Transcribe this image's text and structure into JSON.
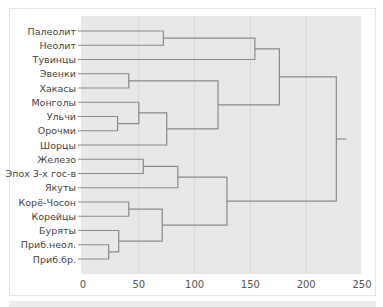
{
  "chart_data": {
    "type": "dendrogram",
    "title": "",
    "xlabel": "",
    "ylabel": "",
    "xlim": [
      0,
      250
    ],
    "x_ticks": [
      0,
      50,
      100,
      150,
      200,
      250
    ],
    "grid": true,
    "leaves": [
      "Палеолит",
      "Неолит",
      "Тувинцы",
      "Эвенки",
      "Хакасы",
      "Монголы",
      "Ульчи",
      "Орочми",
      "Шорцы",
      "Железо",
      "Эпох 3-х гос-в",
      "Якуты",
      "Корё-Чосон",
      "Корейцы",
      "Буряты",
      "Приб.неол.",
      "Приб.бр."
    ],
    "merges": [
      {
        "members": [
          "Палеолит",
          "Неолит"
        ],
        "height": 72
      },
      {
        "members": [
          "Палеолит+Неолит",
          "Тувинцы"
        ],
        "height": 154
      },
      {
        "members": [
          "Эвенки",
          "Хакасы"
        ],
        "height": 41
      },
      {
        "members": [
          "Ульчи",
          "Орочми"
        ],
        "height": 31
      },
      {
        "members": [
          "Монголы",
          "Ульчи+Орочми"
        ],
        "height": 50
      },
      {
        "members": [
          "Монголы+Ульчи+Орочми",
          "Шорцы"
        ],
        "height": 75
      },
      {
        "members": [
          "Эвенки+Хакасы",
          "Монголы+Ульчи+Орочми+Шорцы"
        ],
        "height": 121
      },
      {
        "members": [
          "Палеолит+Неолит+Тувинцы",
          "Эвенки...Шорцы"
        ],
        "height": 176
      },
      {
        "members": [
          "Железо",
          "Эпох 3-х гос-в"
        ],
        "height": 54
      },
      {
        "members": [
          "Железо+Эпох 3-х гос-в",
          "Якуты"
        ],
        "height": 85
      },
      {
        "members": [
          "Корё-Чосон",
          "Корейцы"
        ],
        "height": 41
      },
      {
        "members": [
          "Приб.неол.",
          "Приб.бр."
        ],
        "height": 23
      },
      {
        "members": [
          "Буряты",
          "Приб.неол.+Приб.бр."
        ],
        "height": 32
      },
      {
        "members": [
          "Корё-Чосон+Корейцы",
          "Буряты+Приб."
        ],
        "height": 71
      },
      {
        "members": [
          "Железо+Эпох+Якуты",
          "Корё-Чосон...Приб.бр."
        ],
        "height": 129
      },
      {
        "members": [
          "top cluster",
          "bottom cluster"
        ],
        "height": 227
      }
    ]
  },
  "colors": {
    "plot_bg": "#e8e8e8",
    "line": "#8a8a8a",
    "grid": "#d6d6d6",
    "text": "#444444"
  }
}
